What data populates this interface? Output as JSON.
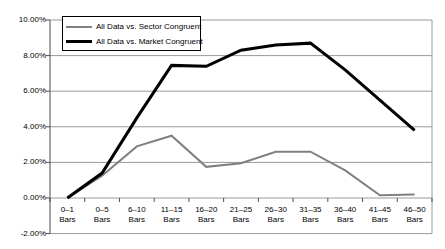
{
  "chart_data": {
    "type": "line",
    "title": "",
    "xlabel": "",
    "ylabel": "",
    "grid": true,
    "legend_position": "top-left",
    "ylim": [
      -2.0,
      10.0
    ],
    "ytick_labels": [
      "10.00%",
      "8.00%",
      "6.00%",
      "4.00%",
      "2.00%",
      "0.00%",
      "-2.00%"
    ],
    "ytick_values": [
      10.0,
      8.0,
      6.0,
      4.0,
      2.0,
      0.0,
      -2.0
    ],
    "categories": [
      "0–1 Bars",
      "0–5 Bars",
      "6–10 Bars",
      "11–15 Bars",
      "16–20 Bars",
      "21–25 Bars",
      "26–30 Bars",
      "31–35 Bars",
      "36–40 Bars",
      "41–45 Bars",
      "46–50 Bars"
    ],
    "category_lines": [
      [
        "0–1",
        "Bars"
      ],
      [
        "0–5",
        "Bars"
      ],
      [
        "6–10",
        "Bars"
      ],
      [
        "11–15",
        "Bars"
      ],
      [
        "16–20",
        "Bars"
      ],
      [
        "21–25",
        "Bars"
      ],
      [
        "26–30",
        "Bars"
      ],
      [
        "31–35",
        "Bars"
      ],
      [
        "36–40",
        "Bars"
      ],
      [
        "41–45",
        "Bars"
      ],
      [
        "46–50",
        "Bars"
      ]
    ],
    "series": [
      {
        "name": "All Data vs. Sector Congruent",
        "color": "#808080",
        "width": 2,
        "values": [
          0.0,
          1.25,
          2.9,
          3.5,
          1.75,
          1.95,
          2.6,
          2.6,
          1.55,
          0.15,
          0.2
        ]
      },
      {
        "name": "All Data vs. Market Congruent",
        "color": "#000000",
        "width": 3,
        "values": [
          0.0,
          1.4,
          4.5,
          7.45,
          7.4,
          8.3,
          8.6,
          8.7,
          7.2,
          5.5,
          3.8
        ]
      }
    ]
  },
  "legend": {
    "entries": [
      {
        "label": "All Data vs. Sector Congruent"
      },
      {
        "label": "All Data vs. Market Congruent"
      }
    ]
  }
}
